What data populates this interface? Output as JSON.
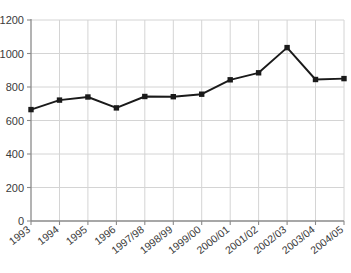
{
  "chart_data": {
    "type": "line",
    "title": "",
    "xlabel": "",
    "ylabel": "",
    "categories": [
      "1993",
      "1994",
      "1995",
      "1996",
      "1997/98",
      "1998/99",
      "1999/00",
      "2000/01",
      "2001/02",
      "2002/03",
      "2003/04",
      "2004/05"
    ],
    "values": [
      665,
      722,
      740,
      675,
      743,
      742,
      757,
      843,
      885,
      1035,
      845,
      850
    ],
    "series": [
      {
        "name": "series-1",
        "values": [
          665,
          722,
          740,
          675,
          743,
          742,
          757,
          843,
          885,
          1035,
          845,
          850
        ]
      }
    ],
    "ylim": [
      0,
      1200
    ],
    "ytick_values": [
      0,
      200,
      400,
      600,
      800,
      1000,
      1200
    ],
    "ytick_labels": [
      "0",
      "200",
      "400",
      "600",
      "800",
      "1000",
      "1200"
    ],
    "grid": true,
    "grid_axis": "both",
    "legend": false,
    "legend_position": "none",
    "marker": "square",
    "line_color": "#1a1a1a",
    "marker_color": "#1a1a1a",
    "grid_color": "#d4d4d4",
    "axis_color": "#8a8a8a",
    "background_color": "#ffffff",
    "xtick_label_rotation": -38
  }
}
